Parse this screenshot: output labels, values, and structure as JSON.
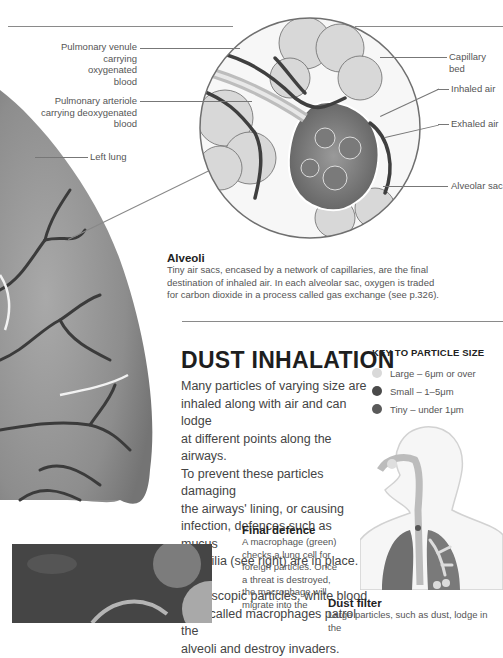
{
  "top_text_fragment": "",
  "labels": {
    "pulmonary_venule": [
      "Pulmonary venule",
      "carrying oxygenated",
      "blood"
    ],
    "pulmonary_arteriole": [
      "Pulmonary arteriole",
      "carrying deoxygenated",
      "blood"
    ],
    "left_lung": "Left lung",
    "capillary_bed": "Capillary bed",
    "inhaled_air": "Inhaled air",
    "exhaled_air": "Exhaled air",
    "alveolar_sac": "Alveolar sac"
  },
  "alveoli": {
    "heading": "Alveoli",
    "text_lines": [
      "Tiny air sacs, encased by a network of capillaries, are the final",
      "destination of inhaled air. In each alveolar sac, oxygen is traded",
      "for carbon dioxide in a process called gas exchange (see p.326)."
    ]
  },
  "dust_inhalation": {
    "title": "DUST INHALATION",
    "body_lines": [
      "Many particles of varying size are",
      "inhaled along with air and can lodge",
      "at different points along the airways.",
      "To prevent these particles damaging",
      "the airways' lining, or causing",
      "infection, defences such as mucus",
      "and cilia (see right) are in place. For",
      "microscopic particles, white blood",
      "cells called macrophages patrol the",
      "alveoli and destroy invaders."
    ]
  },
  "key": {
    "title": "KEY TO PARTICLE SIZE",
    "items": [
      {
        "label": "Large – 6μm or over",
        "color": "#d9d9d9"
      },
      {
        "label": "Small – 1–5μm",
        "color": "#4a4a4a"
      },
      {
        "label": "Tiny – under 1μm",
        "color": "#5a5a5a"
      }
    ]
  },
  "final_defence": {
    "heading": "Final defence",
    "text_lines": [
      "A macrophage (green)",
      "checks a lung cell for",
      "foreign particles. Once",
      "a threat is destroyed,",
      "the macrophage will",
      "migrate into the"
    ]
  },
  "dust_filter": {
    "heading": "Dust filter",
    "text_lines": [
      "Large particles, such as dust, lodge in the"
    ]
  }
}
